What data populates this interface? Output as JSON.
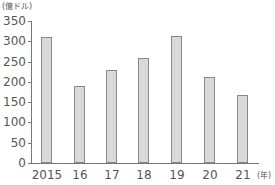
{
  "chart_data": {
    "type": "bar",
    "title": "",
    "xlabel": "(年)",
    "ylabel": "(億ドル)",
    "categories": [
      "2015",
      "16",
      "17",
      "18",
      "19",
      "20",
      "21"
    ],
    "values": [
      310,
      190,
      230,
      258,
      312,
      213,
      168
    ],
    "ylim": [
      0,
      350
    ],
    "yticks": [
      0,
      50,
      100,
      150,
      200,
      250,
      300,
      350
    ],
    "grid": false,
    "legend": null,
    "bar_color": "#d9d9d9",
    "bar_edge_color": "#888888"
  },
  "labels": {
    "y_unit": "(億ドル)",
    "x_unit": "(年)"
  }
}
